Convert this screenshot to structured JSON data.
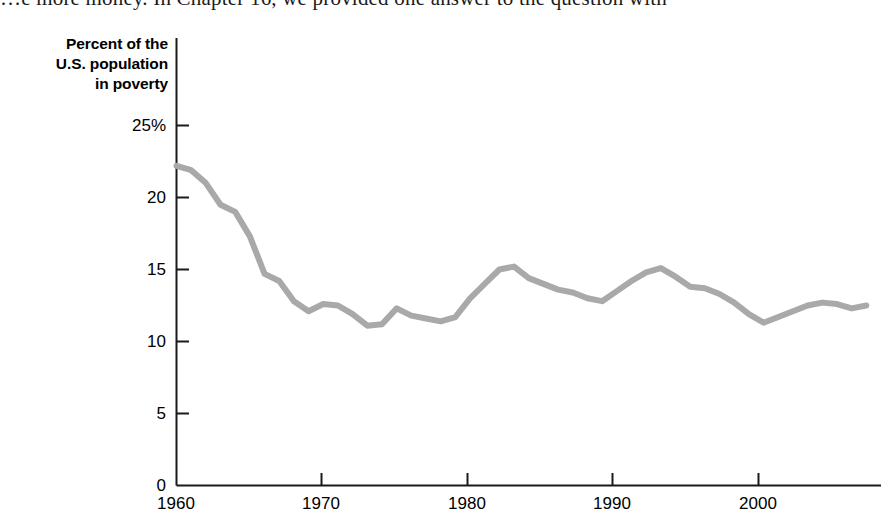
{
  "page": {
    "body_text_line": "…e more money. In Chapter 16, we provided one answer to the question with "
  },
  "figure": {
    "y_axis_title_line1": "Percent of the",
    "y_axis_title_line2": "U.S. population",
    "y_axis_title_line3": "in poverty"
  },
  "chart_data": {
    "type": "line",
    "title": "",
    "xlabel": "",
    "ylabel": "Percent of the U.S. population in poverty",
    "xlim": [
      1960,
      2008
    ],
    "ylim": [
      0,
      25
    ],
    "grid": false,
    "legend": null,
    "line_color": "#a9a9a9",
    "line_width_px": 6,
    "y_ticks": [
      0,
      5,
      10,
      15,
      20,
      25
    ],
    "y_tick_labels": [
      "0",
      "5",
      "10",
      "15",
      "20",
      "25%"
    ],
    "x_ticks": [
      1960,
      1970,
      1980,
      1990,
      2000
    ],
    "x_tick_labels": [
      "1960",
      "1970",
      "1980",
      "1990",
      "2000"
    ],
    "series": [
      {
        "name": "U.S. poverty rate",
        "x": [
          1960,
          1961,
          1962,
          1963,
          1964,
          1965,
          1966,
          1967,
          1968,
          1969,
          1970,
          1971,
          1972,
          1973,
          1974,
          1975,
          1976,
          1977,
          1978,
          1979,
          1980,
          1981,
          1982,
          1983,
          1984,
          1985,
          1986,
          1987,
          1988,
          1989,
          1990,
          1991,
          1992,
          1993,
          1994,
          1995,
          1996,
          1997,
          1998,
          1999,
          2000,
          2001,
          2002,
          2003,
          2004,
          2005,
          2006,
          2007
        ],
        "values": [
          22.2,
          21.9,
          21.0,
          19.5,
          19.0,
          17.3,
          14.7,
          14.2,
          12.8,
          12.1,
          12.6,
          12.5,
          11.9,
          11.1,
          11.2,
          12.3,
          11.8,
          11.6,
          11.4,
          11.7,
          13.0,
          14.0,
          15.0,
          15.2,
          14.4,
          14.0,
          13.6,
          13.4,
          13.0,
          12.8,
          13.5,
          14.2,
          14.8,
          15.1,
          14.5,
          13.8,
          13.7,
          13.3,
          12.7,
          11.9,
          11.3,
          11.7,
          12.1,
          12.5,
          12.7,
          12.6,
          12.3,
          12.5
        ]
      }
    ]
  }
}
